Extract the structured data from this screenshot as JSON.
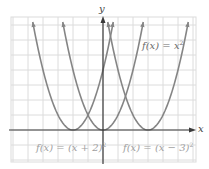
{
  "figure": {
    "title": "",
    "x_axis_label": "x",
    "y_axis_label": "y",
    "colors": {
      "grid": "#dcdcdc",
      "axis": "#3a3a3a",
      "curve": "#858585",
      "label_dark": "#6a6a6a",
      "label_light": "#a0a0a0"
    },
    "labels": [
      {
        "id": "base",
        "text": "f(x) = x",
        "sup": "2"
      },
      {
        "id": "left",
        "text": "f(x) = (x + 2)",
        "sup": "2"
      },
      {
        "id": "right",
        "text": "f(x) = (x − 3)",
        "sup": "2"
      }
    ]
  },
  "chart_data": {
    "type": "line",
    "title": "",
    "xlabel": "x",
    "ylabel": "y",
    "grid": true,
    "xlim": [
      -6,
      6
    ],
    "ylim": [
      -2,
      7
    ],
    "legend": "inline labels",
    "series": [
      {
        "name": "f(x) = x^2",
        "expression": "x^2",
        "vertex": [
          0,
          0
        ]
      },
      {
        "name": "f(x) = (x + 2)^2",
        "expression": "(x+2)^2",
        "vertex": [
          -2,
          0
        ]
      },
      {
        "name": "f(x) = (x - 3)^2",
        "expression": "(x-3)^2",
        "vertex": [
          3,
          0
        ]
      }
    ]
  }
}
